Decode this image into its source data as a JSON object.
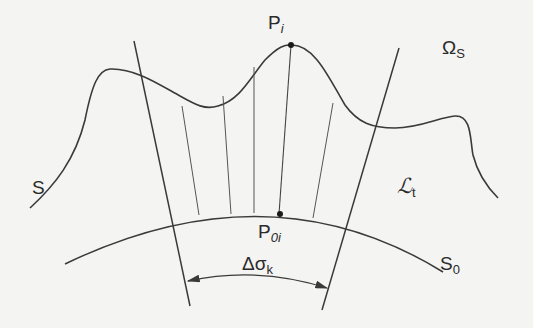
{
  "diagram": {
    "type": "geometric-projection-figure",
    "colors": {
      "stroke": "#3a3a3a",
      "background": "#f4f4f2",
      "text": "#2a2a2a"
    },
    "labels": {
      "p_i": {
        "main": "P",
        "sub": "i"
      },
      "omega_s": {
        "main": "Ω",
        "sub": "S"
      },
      "s": {
        "main": "S"
      },
      "l_t": {
        "main": "ℒ",
        "sub": "t"
      },
      "p_0i": {
        "main": "P",
        "sub": "0i"
      },
      "s_0": {
        "main": "S",
        "sub": "0"
      },
      "delta_sigma": {
        "main": "Δσ",
        "sub": "k"
      }
    },
    "elements": [
      "upper wavy surface S",
      "lower arc S0",
      "two bounding radial lines",
      "five intermediate projection lines",
      "points Pi and P0i",
      "double-arrow arc Δσk"
    ]
  }
}
